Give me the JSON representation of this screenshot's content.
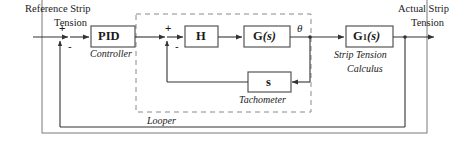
{
  "diagram": {
    "frame": {
      "name": "outer-system-boundary"
    },
    "inputs": {
      "reference_line1": "Reference Strip",
      "reference_line2": "Tension"
    },
    "outputs": {
      "actual_line1": "Actual Strip",
      "actual_line2": "Tension"
    },
    "blocks": [
      {
        "id": "pid",
        "label": "PID",
        "caption": "Controller"
      },
      {
        "id": "h",
        "label": "H",
        "caption": ""
      },
      {
        "id": "g",
        "label_main": "G",
        "label_arg": "(s)",
        "caption": ""
      },
      {
        "id": "g1",
        "label_main": "G",
        "label_sub": "1",
        "label_arg": "(s)",
        "caption_line1": "Strip Tension",
        "caption_line2": "Calculus"
      },
      {
        "id": "tach",
        "label": "s",
        "caption": "Tachometer"
      }
    ],
    "groups": [
      {
        "id": "looper",
        "label": "Looper",
        "style": "dashed"
      }
    ],
    "signals": [
      {
        "id": "theta",
        "label": "θ"
      }
    ],
    "summing_junctions": [
      {
        "id": "outer-sum",
        "plus": "+",
        "minus": "-"
      },
      {
        "id": "inner-sum",
        "plus": "+",
        "minus": "-"
      }
    ],
    "colors": {
      "line": "#333333",
      "block_border": "#555555",
      "dashed": "#888888",
      "frame": "#7a7a7a",
      "text": "#1a1a1a",
      "background": "#ffffff"
    }
  }
}
